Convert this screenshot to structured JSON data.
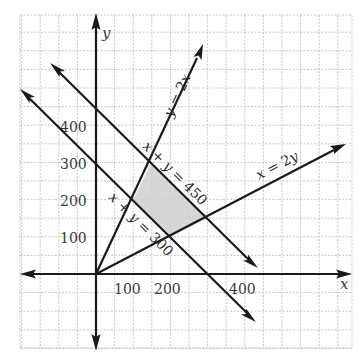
{
  "chart_data": {
    "type": "line",
    "title": "",
    "xlabel": "x",
    "ylabel": "y",
    "xlim": [
      -200,
      690
    ],
    "ylim": [
      -200,
      700
    ],
    "grid": true,
    "grid_step": 50,
    "x_ticks": [
      {
        "value": 100,
        "label": "100"
      },
      {
        "value": 200,
        "label": "200"
      },
      {
        "value": 400,
        "label": "400"
      }
    ],
    "y_ticks": [
      {
        "value": 100,
        "label": "100"
      },
      {
        "value": 200,
        "label": "200"
      },
      {
        "value": 300,
        "label": "300"
      },
      {
        "value": 400,
        "label": "400"
      }
    ],
    "series": [
      {
        "name": "y = 2x",
        "label": "y = 2x",
        "x": [
          0,
          287
        ],
        "y": [
          0,
          574
        ]
      },
      {
        "name": "x = 2y",
        "label": "x = 2y",
        "x": [
          0,
          670
        ],
        "y": [
          0,
          335
        ]
      },
      {
        "name": "x + y = 450",
        "label": "x + y = 450",
        "x": [
          -122,
          434
        ],
        "y": [
          569,
          16
        ]
      },
      {
        "name": "x + y = 300",
        "label": "x + y = 300",
        "x": [
          -203,
          429
        ],
        "y": [
          497,
          -127
        ]
      }
    ],
    "shaded_region": {
      "description": "feasible region bounded by y=2x, x=2y, x+y=300, x+y=450",
      "vertices": [
        [
          150,
          300
        ],
        [
          300,
          150
        ],
        [
          200,
          100
        ],
        [
          100,
          200
        ]
      ],
      "color": "#cfcfcf"
    },
    "annotations": [
      {
        "text": "y = 2x",
        "line": "y = 2x"
      },
      {
        "text": "x = 2y",
        "line": "x = 2y"
      },
      {
        "text": "x + y = 450",
        "line": "x + y = 450"
      },
      {
        "text": "x + y = 300",
        "line": "x + y = 300"
      }
    ]
  },
  "labels": {
    "x_axis": "x",
    "y_axis": "y",
    "xtick_100": "100",
    "xtick_200": "200",
    "xtick_400": "400",
    "ytick_100": "100",
    "ytick_200": "200",
    "ytick_300": "300",
    "ytick_400": "400",
    "eq_y2x_a": "y",
    "eq_y2x_b": " = 2",
    "eq_y2x_c": "x",
    "eq_x2y_a": "x",
    "eq_x2y_b": " = 2",
    "eq_x2y_c": "y",
    "eq_450_a": "x",
    "eq_450_b": " + ",
    "eq_450_c": "y",
    "eq_450_d": " = 450",
    "eq_300_a": "x",
    "eq_300_b": " + ",
    "eq_300_c": "y",
    "eq_300_d": " = 300"
  },
  "colors": {
    "line": "#1a1a1a",
    "grid": "#b8b8b8",
    "region": "#cfcfcf",
    "text": "#3a3a3a"
  }
}
